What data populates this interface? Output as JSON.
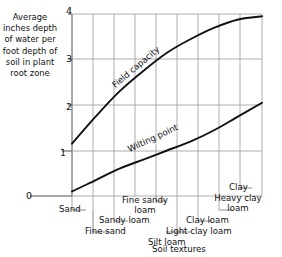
{
  "chart_data": {
    "type": "line",
    "title": "",
    "ylabel": "Average inches depth of water per foot depth of soil in plant root zone",
    "xlabel": "Soil textures",
    "ylim": [
      0,
      4
    ],
    "yticks": [
      0,
      1,
      2,
      3,
      4
    ],
    "ytick_labels": [
      "0",
      "1",
      "2",
      "3",
      "4"
    ],
    "grid": true,
    "legend": "inline-curve-labels",
    "categories": [
      "Sand",
      "Fine sand",
      "Sandy loam",
      "Fine sandy loam",
      "Light clay loam",
      "Silt loam",
      "Clay loam",
      "Heavy clay loam",
      "Clay"
    ],
    "series": [
      {
        "name": "Field capacity",
        "values": [
          1.15,
          1.75,
          2.3,
          2.75,
          3.15,
          3.45,
          3.7,
          3.88,
          3.95
        ]
      },
      {
        "name": "Wilting point",
        "values": [
          0.1,
          0.35,
          0.6,
          0.8,
          1.0,
          1.2,
          1.45,
          1.75,
          2.05
        ]
      }
    ],
    "annotations": [
      {
        "text": "Field capacity",
        "type": "curve-label",
        "series": "Field capacity"
      },
      {
        "text": "Wilting point",
        "type": "curve-label",
        "series": "Wilting point"
      }
    ]
  },
  "axis": {
    "y_label_text": "Average inches depth of water per foot depth of soil in plant root zone",
    "x_axis_title": "Soil textures",
    "ticks": {
      "four": "4",
      "three": "3",
      "two": "2",
      "one": "1",
      "zero": "0"
    }
  },
  "curve_labels": {
    "field_capacity": "Field capacity",
    "wilting_point": "Wilting point"
  },
  "texture_labels": {
    "sand": "Sand",
    "fine_sand": "Fine sand",
    "sandy_loam": "Sandy loam",
    "fine_sandy_loam_line1": "Fine sandy",
    "fine_sandy_loam_line2": "loam",
    "light_clay_loam": "Light clay loam",
    "silt_loam": "Silt loam",
    "clay_loam": "Clay loam",
    "heavy_clay_loam_line1": "Heavy clay",
    "heavy_clay_loam_line2": "loam",
    "clay": "Clay"
  },
  "colors": {
    "curve": "#111111",
    "grid": "#9a9a9a",
    "axis": "#6f6f6f",
    "leader": "#6f6f6f",
    "background": "#ffffff",
    "text": "#111111"
  }
}
